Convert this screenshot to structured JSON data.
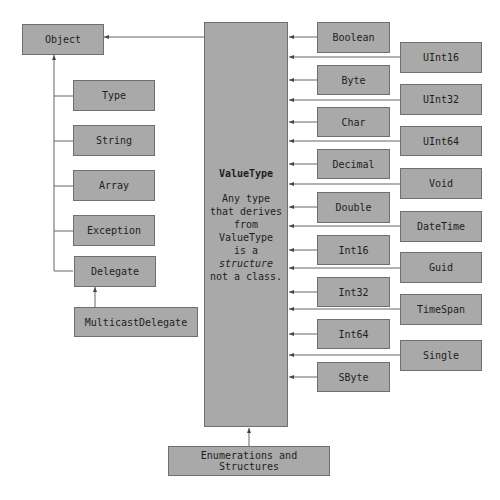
{
  "diagram": {
    "root": {
      "label": "Object"
    },
    "object_children": [
      {
        "label": "Type"
      },
      {
        "label": "String"
      },
      {
        "label": "Array"
      },
      {
        "label": "Exception"
      },
      {
        "label": "Delegate"
      }
    ],
    "delegate_child": {
      "label": "MulticastDelegate"
    },
    "value_type": {
      "title": "ValueType",
      "desc_line1": "Any type",
      "desc_line2": "that derives",
      "desc_line3": "from",
      "desc_line4": "ValueType",
      "desc_line5": "is a",
      "desc_line6": "structure",
      "desc_line7": "not a class."
    },
    "value_types_inner": [
      {
        "label": "Boolean"
      },
      {
        "label": "Byte"
      },
      {
        "label": "Char"
      },
      {
        "label": "Decimal"
      },
      {
        "label": "Double"
      },
      {
        "label": "Int16"
      },
      {
        "label": "Int32"
      },
      {
        "label": "Int64"
      },
      {
        "label": "SByte"
      }
    ],
    "value_types_outer": [
      {
        "label": "UInt16"
      },
      {
        "label": "UInt32"
      },
      {
        "label": "UInt64"
      },
      {
        "label": "Void"
      },
      {
        "label": "DateTime"
      },
      {
        "label": "Guid"
      },
      {
        "label": "TimeSpan"
      },
      {
        "label": "Single"
      }
    ],
    "value_type_child": {
      "label": "Enumerations and Structures"
    },
    "colors": {
      "box_fill": "#a9a9a9",
      "box_border": "#6f6f6f",
      "line": "#555555",
      "text": "#1e1e1e"
    }
  }
}
